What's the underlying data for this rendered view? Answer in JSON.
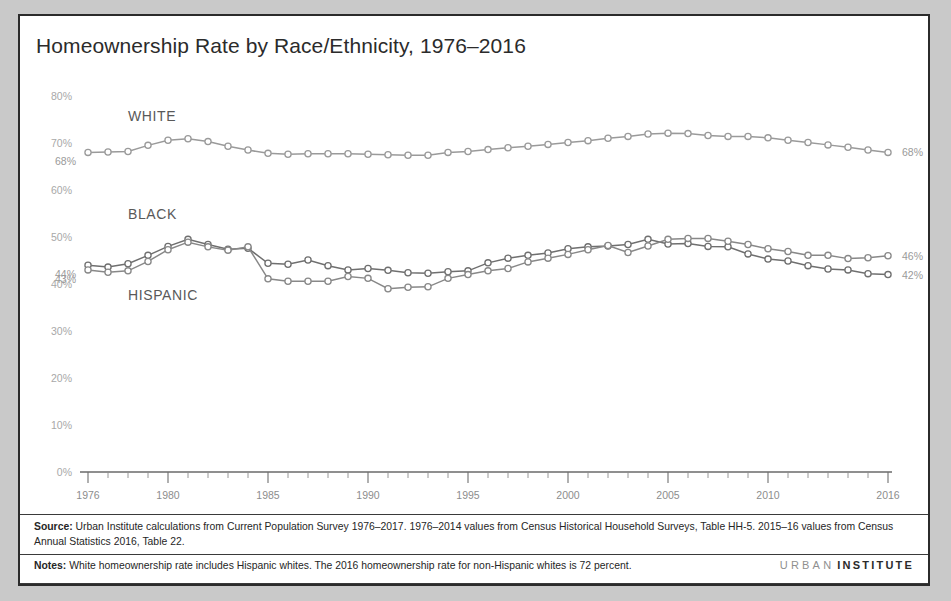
{
  "title": "Homeownership Rate by Race/Ethnicity, 1976–2016",
  "footer": {
    "source_label": "Source:",
    "source_text": " Urban Institute calculations from Current Population Survey 1976–2017. 1976–2014 values from Census Historical Household Surveys, Table HH-5. 2015–16 values from Census Annual Statistics 2016, Table 22.",
    "notes_label": "Notes:",
    "notes_text": " White homeownership rate includes Hispanic whites. The 2016 homeownership rate for non-Hispanic whites is 72 percent.",
    "logo_first": "URBAN",
    "logo_second": "INSTITUTE"
  },
  "chart_data": {
    "type": "line",
    "title": "Homeownership Rate by Race/Ethnicity, 1976–2016",
    "xlabel": "",
    "ylabel": "",
    "ylim": [
      0,
      80
    ],
    "xlim": [
      1976,
      2016
    ],
    "grid": false,
    "legend_position": "inline-labels",
    "ytick_labels": [
      "0%",
      "10%",
      "20%",
      "30%",
      "40%",
      "50%",
      "60%",
      "70%",
      "80%"
    ],
    "ytick_values": [
      0,
      10,
      20,
      30,
      40,
      50,
      60,
      70,
      80
    ],
    "xtick_labels": [
      "1976",
      "1980",
      "1985",
      "1990",
      "1995",
      "2000",
      "2005",
      "2010",
      "2016"
    ],
    "xtick_values": [
      1976,
      1980,
      1985,
      1990,
      1995,
      2000,
      2005,
      2010,
      2016
    ],
    "x": [
      1976,
      1977,
      1978,
      1979,
      1980,
      1981,
      1982,
      1983,
      1984,
      1985,
      1986,
      1987,
      1988,
      1989,
      1990,
      1991,
      1992,
      1993,
      1994,
      1995,
      1996,
      1997,
      1998,
      1999,
      2000,
      2001,
      2002,
      2003,
      2004,
      2005,
      2006,
      2007,
      2008,
      2009,
      2010,
      2011,
      2012,
      2013,
      2014,
      2015,
      2016
    ],
    "series": [
      {
        "name": "WHITE",
        "color": "#9a9a9a",
        "start_label": "68%",
        "end_label": "68%",
        "values": [
          68.0,
          68.1,
          68.2,
          69.5,
          70.6,
          70.9,
          70.3,
          69.3,
          68.5,
          67.8,
          67.6,
          67.7,
          67.7,
          67.7,
          67.6,
          67.5,
          67.4,
          67.4,
          68.0,
          68.2,
          68.6,
          69.0,
          69.3,
          69.7,
          70.1,
          70.5,
          71.0,
          71.4,
          71.9,
          72.1,
          72.0,
          71.6,
          71.4,
          71.4,
          71.1,
          70.6,
          70.1,
          69.6,
          69.1,
          68.5,
          68.0
        ]
      },
      {
        "name": "BLACK",
        "color": "#6f6f6f",
        "start_label": "44%",
        "end_label": "42%",
        "values": [
          44.0,
          43.6,
          44.3,
          46.1,
          48.0,
          49.5,
          48.4,
          47.4,
          47.6,
          44.4,
          44.2,
          45.1,
          43.9,
          43.0,
          43.3,
          42.9,
          42.4,
          42.3,
          42.6,
          42.8,
          44.5,
          45.5,
          46.1,
          46.6,
          47.5,
          47.9,
          48.1,
          48.4,
          49.5,
          48.5,
          48.6,
          48.0,
          47.9,
          46.4,
          45.3,
          44.9,
          43.9,
          43.2,
          43.0,
          42.2,
          42.0
        ]
      },
      {
        "name": "HISPANIC",
        "color": "#888888",
        "start_label": "43%",
        "end_label": "46%",
        "values": [
          43.0,
          42.5,
          42.8,
          44.8,
          47.3,
          48.9,
          47.9,
          47.2,
          47.9,
          41.1,
          40.6,
          40.6,
          40.6,
          41.6,
          41.2,
          39.0,
          39.3,
          39.4,
          41.2,
          42.0,
          42.8,
          43.3,
          44.7,
          45.5,
          46.3,
          47.3,
          48.2,
          46.7,
          48.1,
          49.5,
          49.7,
          49.7,
          49.1,
          48.4,
          47.5,
          46.9,
          46.1,
          46.1,
          45.4,
          45.6,
          46.0
        ]
      }
    ],
    "inline_labels": [
      {
        "text": "WHITE",
        "x": 1978.0,
        "y": 74.6
      },
      {
        "text": "BLACK",
        "x": 1978.0,
        "y": 53.8
      },
      {
        "text": "HISPANIC",
        "x": 1978.0,
        "y": 36.5
      }
    ]
  }
}
